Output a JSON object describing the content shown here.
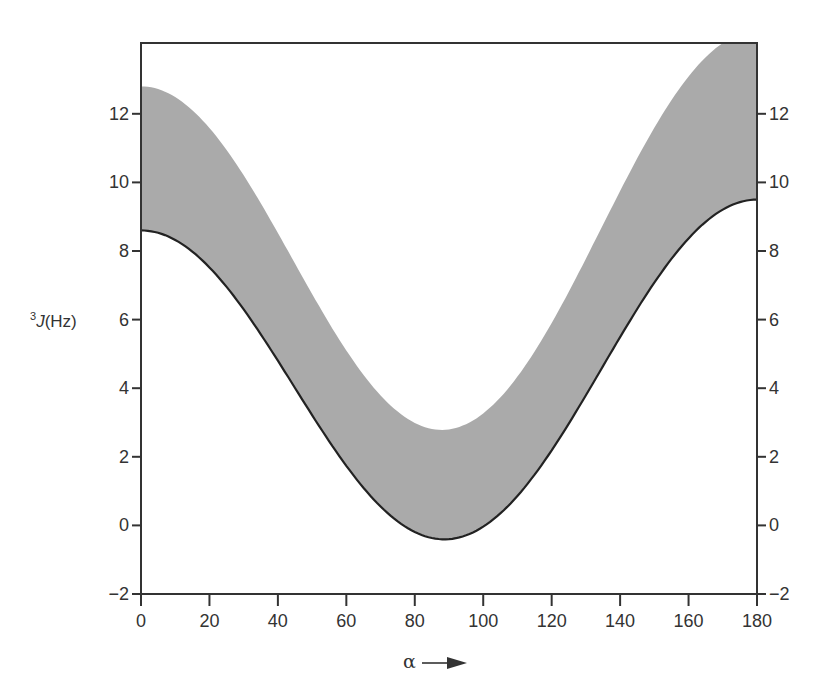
{
  "chart_data": {
    "type": "area",
    "title": "",
    "xlabel": "α",
    "xlabel_arrow": "→",
    "ylabel": "³J(Hz)",
    "ylabel_superscript": "3",
    "ylabel_main": "J",
    "ylabel_unit": "(Hz)",
    "xlim": [
      0,
      180
    ],
    "ylim": [
      -2,
      14.1
    ],
    "grid": false,
    "legend": null,
    "x_ticks": [
      0,
      20,
      40,
      60,
      80,
      100,
      120,
      140,
      160,
      180
    ],
    "y_ticks_left": [
      -2,
      0,
      2,
      4,
      6,
      8,
      10,
      12
    ],
    "y_ticks_right": [
      -2,
      0,
      2,
      4,
      6,
      8,
      10,
      12
    ],
    "series": [
      {
        "name": "lower bound (Karplus curve, solid line)",
        "model": "A*cos^2(a) + B*cos(a) + C",
        "A": 9.45,
        "B": -0.45,
        "C": -0.4,
        "x": [
          0,
          20,
          40,
          60,
          80,
          90,
          100,
          120,
          140,
          160,
          180
        ],
        "values": [
          8.6,
          7.5,
          4.8,
          1.7,
          -0.2,
          -0.4,
          -0.0,
          2.0,
          5.5,
          8.3,
          9.5
        ]
      },
      {
        "name": "upper bound (shaded band edge)",
        "model": "A*cos^2(a) + B*cos(a) + C",
        "A": 10.8,
        "B": -0.8,
        "C": 2.8,
        "x": [
          0,
          20,
          40,
          60,
          80,
          87,
          100,
          120,
          140,
          160,
          180
        ],
        "values": [
          12.8,
          11.6,
          8.5,
          5.1,
          3.0,
          2.8,
          3.3,
          5.9,
          9.7,
          12.5,
          13.6
        ]
      }
    ],
    "fill_between": {
      "lower": 0,
      "upper": 1,
      "color": "#aaaaaa"
    },
    "colors": {
      "band": "#aaaaaa",
      "line": "#222222",
      "frame": "#333333",
      "background": "#ffffff"
    }
  }
}
